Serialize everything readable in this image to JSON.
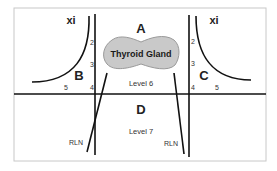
{
  "diagram": {
    "frame_color": "#c8c8c8",
    "line_color": "#111111",
    "gland_fill": "#c9c9c9",
    "gland_stroke": "#9a9a9a",
    "regions": {
      "A": "A",
      "B": "B",
      "C": "C",
      "D": "D"
    },
    "gland_label": "Thyroid Gland",
    "levels": {
      "upper": "Level 6",
      "lower": "Level 7"
    },
    "nerve_labels": {
      "left": "xi",
      "right": "xi"
    },
    "rln_labels": {
      "left": "RLN",
      "right": "RLN"
    },
    "left_numbers": [
      "2",
      "3",
      "4",
      "5"
    ],
    "right_numbers": [
      "2",
      "3",
      "4",
      "5"
    ]
  }
}
